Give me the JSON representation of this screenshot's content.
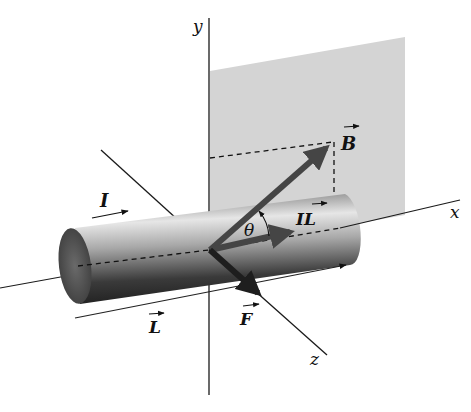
{
  "figure": {
    "type": "physics-diagram",
    "axes": {
      "x": {
        "label": "x"
      },
      "y": {
        "label": "y"
      },
      "z": {
        "label": "z"
      }
    },
    "labels": {
      "current": "I",
      "length_vector": "L",
      "il_vector": "IL",
      "field_vector": "B",
      "force_vector": "F",
      "angle": "θ"
    },
    "colors": {
      "plane": "#d4d4d4",
      "axis": "#1a1a1a",
      "vector": "#404040",
      "wire_light": "#e8e8e8",
      "wire_dark": "#2a2a2a"
    }
  }
}
